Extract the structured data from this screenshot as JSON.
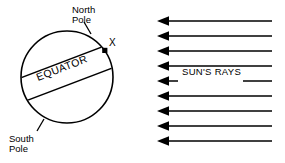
{
  "diagram": {
    "background_color": "#ffffff",
    "stroke_color": "#000000",
    "labels": {
      "north_pole_line1": "North",
      "north_pole_line2": "Pole",
      "south_pole_line1": "South",
      "south_pole_line2": "Pole",
      "equator": "EQUATOR",
      "point_marker": "X",
      "suns_rays": "SUN'S RAYS"
    },
    "earth": {
      "center_x": 67,
      "center_y": 77,
      "radius": 46,
      "equator_tilt_degrees": -21,
      "point_x_position": {
        "x": 105,
        "y": 51
      }
    },
    "rays": {
      "count": 9,
      "direction": "left",
      "start_x": 272,
      "tip_x": 157,
      "first_y": 21,
      "spacing": 15,
      "label_row_index": 4
    }
  }
}
